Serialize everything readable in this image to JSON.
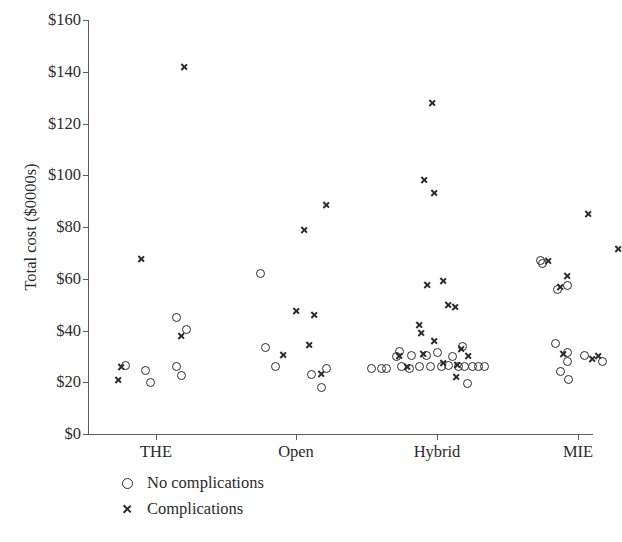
{
  "chart_data": {
    "type": "scatter",
    "title": "",
    "xlabel": "",
    "ylabel": "Total cost ($0000s)",
    "ylim": [
      0,
      160
    ],
    "ytick_labels": [
      "$0",
      "$20",
      "$40",
      "$60",
      "$80",
      "$100",
      "$120",
      "$140",
      "$160"
    ],
    "ytick_values": [
      0,
      20,
      40,
      60,
      80,
      100,
      120,
      140,
      160
    ],
    "categories": [
      "THE",
      "Open",
      "Hybrid",
      "MIE"
    ],
    "grid": false,
    "legend_position": "below-plot-left",
    "marker_color": "#2b2b2b",
    "axis_color": "#5c5c5c",
    "series": [
      {
        "name": "No complications",
        "marker": "circle",
        "points": [
          {
            "category": "THE",
            "x_offset": -0.06,
            "value": 26.5
          },
          {
            "category": "THE",
            "x_offset": -0.02,
            "value": 24.5
          },
          {
            "category": "THE",
            "x_offset": -0.01,
            "value": 20.0
          },
          {
            "category": "THE",
            "x_offset": 0.04,
            "value": 26.0
          },
          {
            "category": "THE",
            "x_offset": 0.05,
            "value": 22.5
          },
          {
            "category": "THE",
            "x_offset": 0.04,
            "value": 45.0
          },
          {
            "category": "THE",
            "x_offset": 0.06,
            "value": 40.5
          },
          {
            "category": "Open",
            "x_offset": -0.07,
            "value": 62.0
          },
          {
            "category": "Open",
            "x_offset": -0.06,
            "value": 33.5
          },
          {
            "category": "Open",
            "x_offset": -0.04,
            "value": 26.0
          },
          {
            "category": "Open",
            "x_offset": 0.03,
            "value": 23.0
          },
          {
            "category": "Open",
            "x_offset": 0.06,
            "value": 25.5
          },
          {
            "category": "Open",
            "x_offset": 0.05,
            "value": 18.0
          },
          {
            "category": "Hybrid",
            "x_offset": -0.13,
            "value": 25.5
          },
          {
            "category": "Hybrid",
            "x_offset": -0.11,
            "value": 25.5
          },
          {
            "category": "Hybrid",
            "x_offset": -0.1,
            "value": 25.5
          },
          {
            "category": "Hybrid",
            "x_offset": -0.08,
            "value": 30.0
          },
          {
            "category": "Hybrid",
            "x_offset": -0.075,
            "value": 32.0
          },
          {
            "category": "Hybrid",
            "x_offset": -0.07,
            "value": 26.0
          },
          {
            "category": "Hybrid",
            "x_offset": -0.055,
            "value": 25.5
          },
          {
            "category": "Hybrid",
            "x_offset": -0.05,
            "value": 30.5
          },
          {
            "category": "Hybrid",
            "x_offset": -0.035,
            "value": 26.0
          },
          {
            "category": "Hybrid",
            "x_offset": -0.02,
            "value": 30.5
          },
          {
            "category": "Hybrid",
            "x_offset": -0.012,
            "value": 26.0
          },
          {
            "category": "Hybrid",
            "x_offset": 0.0,
            "value": 31.5
          },
          {
            "category": "Hybrid",
            "x_offset": 0.008,
            "value": 26.0
          },
          {
            "category": "Hybrid",
            "x_offset": 0.022,
            "value": 26.5
          },
          {
            "category": "Hybrid",
            "x_offset": 0.03,
            "value": 30.0
          },
          {
            "category": "Hybrid",
            "x_offset": 0.042,
            "value": 26.0
          },
          {
            "category": "Hybrid",
            "x_offset": 0.05,
            "value": 34.0
          },
          {
            "category": "Hybrid",
            "x_offset": 0.055,
            "value": 26.0
          },
          {
            "category": "Hybrid",
            "x_offset": 0.07,
            "value": 26.0
          },
          {
            "category": "Hybrid",
            "x_offset": 0.082,
            "value": 26.0
          },
          {
            "category": "Hybrid",
            "x_offset": 0.095,
            "value": 26.0
          },
          {
            "category": "Hybrid",
            "x_offset": 0.06,
            "value": 19.5
          },
          {
            "category": "MIE",
            "x_offset": -0.075,
            "value": 67.0
          },
          {
            "category": "MIE",
            "x_offset": -0.02,
            "value": 57.5
          },
          {
            "category": "MIE",
            "x_offset": -0.045,
            "value": 35.0
          },
          {
            "category": "MIE",
            "x_offset": -0.02,
            "value": 31.5
          },
          {
            "category": "MIE",
            "x_offset": -0.02,
            "value": 28.0
          },
          {
            "category": "MIE",
            "x_offset": -0.035,
            "value": 24.0
          },
          {
            "category": "MIE",
            "x_offset": -0.018,
            "value": 21.0
          },
          {
            "category": "MIE",
            "x_offset": 0.012,
            "value": 30.5
          },
          {
            "category": "MIE",
            "x_offset": 0.048,
            "value": 28.0
          },
          {
            "category": "MIE",
            "x_offset": -0.07,
            "value": 66.0
          },
          {
            "category": "MIE",
            "x_offset": -0.04,
            "value": 56.0
          }
        ]
      },
      {
        "name": "Complications",
        "marker": "cross",
        "points": [
          {
            "category": "THE",
            "x_offset": 0.055,
            "value": 142.0
          },
          {
            "category": "THE",
            "x_offset": -0.03,
            "value": 67.5
          },
          {
            "category": "THE",
            "x_offset": 0.05,
            "value": 38.0
          },
          {
            "category": "THE",
            "x_offset": -0.07,
            "value": 26.0
          },
          {
            "category": "THE",
            "x_offset": -0.075,
            "value": 21.0
          },
          {
            "category": "Open",
            "x_offset": 0.06,
            "value": 88.5
          },
          {
            "category": "Open",
            "x_offset": 0.015,
            "value": 79.0
          },
          {
            "category": "Open",
            "x_offset": 0.0,
            "value": 47.5
          },
          {
            "category": "Open",
            "x_offset": 0.035,
            "value": 46.0
          },
          {
            "category": "Open",
            "x_offset": -0.025,
            "value": 30.5
          },
          {
            "category": "Open",
            "x_offset": 0.025,
            "value": 34.5
          },
          {
            "category": "Open",
            "x_offset": 0.05,
            "value": 23.0
          },
          {
            "category": "Hybrid",
            "x_offset": -0.01,
            "value": 128.0
          },
          {
            "category": "Hybrid",
            "x_offset": -0.025,
            "value": 98.0
          },
          {
            "category": "Hybrid",
            "x_offset": -0.005,
            "value": 93.0
          },
          {
            "category": "Hybrid",
            "x_offset": -0.02,
            "value": 57.5
          },
          {
            "category": "Hybrid",
            "x_offset": 0.012,
            "value": 59.0
          },
          {
            "category": "Hybrid",
            "x_offset": 0.022,
            "value": 50.0
          },
          {
            "category": "Hybrid",
            "x_offset": 0.035,
            "value": 49.0
          },
          {
            "category": "Hybrid",
            "x_offset": -0.035,
            "value": 42.0
          },
          {
            "category": "Hybrid",
            "x_offset": -0.032,
            "value": 39.0
          },
          {
            "category": "Hybrid",
            "x_offset": -0.005,
            "value": 36.0
          },
          {
            "category": "Hybrid",
            "x_offset": 0.048,
            "value": 33.0
          },
          {
            "category": "Hybrid",
            "x_offset": 0.062,
            "value": 30.0
          },
          {
            "category": "Hybrid",
            "x_offset": -0.075,
            "value": 30.0
          },
          {
            "category": "Hybrid",
            "x_offset": -0.06,
            "value": 26.0
          },
          {
            "category": "Hybrid",
            "x_offset": -0.028,
            "value": 31.0
          },
          {
            "category": "Hybrid",
            "x_offset": 0.012,
            "value": 27.5
          },
          {
            "category": "Hybrid",
            "x_offset": 0.04,
            "value": 26.5
          },
          {
            "category": "Hybrid",
            "x_offset": 0.038,
            "value": 22.0
          },
          {
            "category": "MIE",
            "x_offset": 0.02,
            "value": 85.0
          },
          {
            "category": "MIE",
            "x_offset": 0.08,
            "value": 71.5
          },
          {
            "category": "MIE",
            "x_offset": -0.06,
            "value": 67.0
          },
          {
            "category": "MIE",
            "x_offset": -0.022,
            "value": 61.0
          },
          {
            "category": "MIE",
            "x_offset": -0.035,
            "value": 57.0
          },
          {
            "category": "MIE",
            "x_offset": 0.028,
            "value": 29.0
          },
          {
            "category": "MIE",
            "x_offset": 0.04,
            "value": 30.0
          },
          {
            "category": "MIE",
            "x_offset": -0.03,
            "value": 31.0
          }
        ]
      }
    ]
  },
  "legend": {
    "entries": [
      {
        "label": "No complications",
        "marker": "circle"
      },
      {
        "label": "Complications",
        "marker": "cross"
      }
    ]
  }
}
